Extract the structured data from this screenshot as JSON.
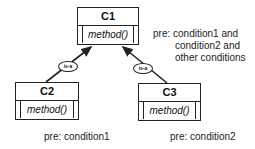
{
  "classes": {
    "c1": {
      "name": "C1",
      "method": "method()"
    },
    "c2": {
      "name": "C2",
      "method": "method()"
    },
    "c3": {
      "name": "C3",
      "method": "method()"
    }
  },
  "relations": {
    "c2_to_c1": "is-a",
    "c3_to_c1": "is-a"
  },
  "notes": {
    "c1_pre": [
      "pre: condition1 and",
      "condition2 and",
      "other conditions"
    ],
    "c2_pre": "pre: condition1",
    "c3_pre": "pre: condition2"
  }
}
